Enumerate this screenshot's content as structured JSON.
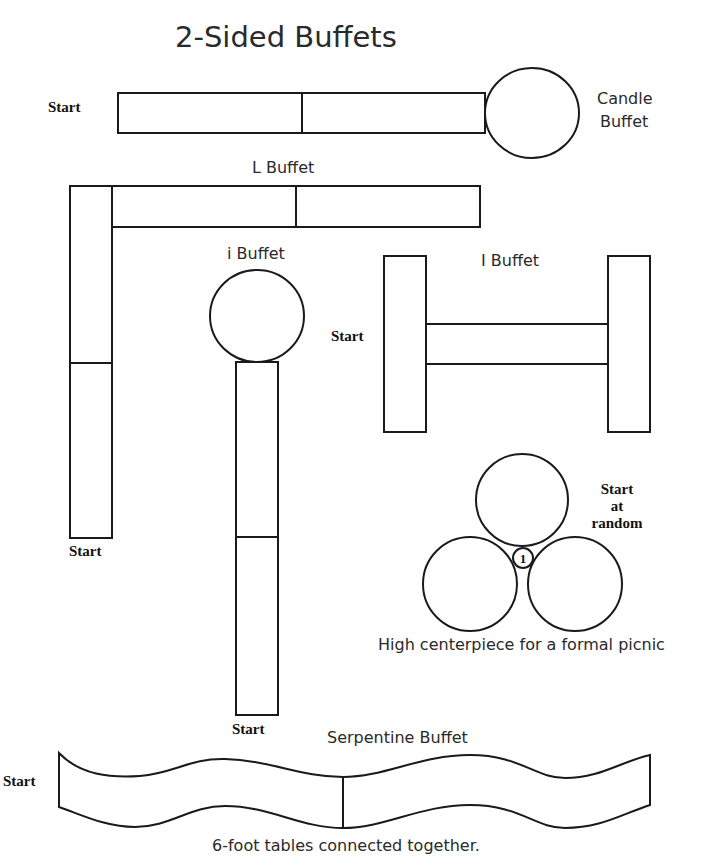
{
  "title": "2-Sided Buffets",
  "colors": {
    "stroke": "#1a1a1a",
    "text": "#2a2a2a",
    "background": "#ffffff"
  },
  "candle_buffet": {
    "label_line1": "Candle",
    "label_line2": "Buffet",
    "start_label": "Start"
  },
  "l_buffet": {
    "label": "L Buffet",
    "start_label": "Start"
  },
  "i_buffet": {
    "label": "i Buffet",
    "start_label": "Start"
  },
  "capital_i_buffet": {
    "label": "I Buffet",
    "start_label": "Start"
  },
  "round_tables": {
    "start_line1": "Start",
    "start_line2": "at",
    "start_line3": "random",
    "center_marker": "1",
    "caption": "High centerpiece for a formal picnic"
  },
  "serpentine_buffet": {
    "label": "Serpentine Buffet",
    "start_label": "Start",
    "caption": "6-foot tables connected together."
  }
}
